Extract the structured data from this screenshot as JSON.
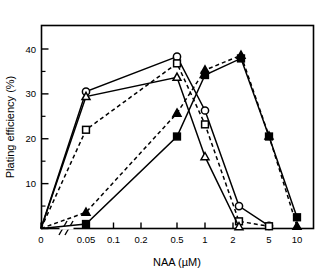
{
  "chart_data": {
    "type": "line",
    "title": "",
    "xlabel": "NAA (µM)",
    "ylabel": "Plating efficiency (%)",
    "x_tick_labels": [
      "0",
      "0.05",
      "0.1",
      "0.2",
      "0.5",
      "1",
      "2",
      "5",
      "10"
    ],
    "y_tick_labels": [
      "0",
      "10",
      "20",
      "30",
      "40"
    ],
    "y_ticks": [
      0,
      10,
      20,
      30,
      40
    ],
    "ylim": [
      0,
      46
    ],
    "x_scale": "log-with-axis-break",
    "axis_break": "between 0 and 0.05",
    "grid": false,
    "legend": "none",
    "series": [
      {
        "name": "open-circle",
        "marker": "open-circle",
        "line": "solid",
        "points": [
          {
            "x": "0",
            "y": 0.0
          },
          {
            "x": "0.05",
            "y": 30.5
          },
          {
            "x": "0.5",
            "y": 38.3
          },
          {
            "x": "1",
            "y": 26.3
          },
          {
            "x": "2.2",
            "y": 5.0
          },
          {
            "x": "5",
            "y": 0.6
          }
        ]
      },
      {
        "name": "open-square",
        "marker": "open-square",
        "line": "dashed",
        "points": [
          {
            "x": "0",
            "y": 0.0
          },
          {
            "x": "0.05",
            "y": 22.0
          },
          {
            "x": "0.5",
            "y": 36.8
          },
          {
            "x": "1",
            "y": 23.2
          },
          {
            "x": "2.2",
            "y": 1.6
          },
          {
            "x": "5",
            "y": 0.5
          }
        ]
      },
      {
        "name": "open-triangle",
        "marker": "open-triangle",
        "line": "solid",
        "points": [
          {
            "x": "0",
            "y": 0.0
          },
          {
            "x": "0.05",
            "y": 29.4
          },
          {
            "x": "0.5",
            "y": 33.7
          },
          {
            "x": "1",
            "y": 16.0
          },
          {
            "x": "2.2",
            "y": 0.4
          }
        ]
      },
      {
        "name": "filled-triangle",
        "marker": "filled-triangle",
        "line": "dashed",
        "points": [
          {
            "x": "0",
            "y": 0.0
          },
          {
            "x": "0.05",
            "y": 3.6
          },
          {
            "x": "0.5",
            "y": 25.7
          },
          {
            "x": "1",
            "y": 35.3
          },
          {
            "x": "2.3",
            "y": 38.6
          },
          {
            "x": "5",
            "y": 20.6
          },
          {
            "x": "10",
            "y": 0.5
          }
        ]
      },
      {
        "name": "filled-square",
        "marker": "filled-square",
        "line": "solid",
        "points": [
          {
            "x": "0",
            "y": 0.0
          },
          {
            "x": "0.05",
            "y": 1.0
          },
          {
            "x": "0.5",
            "y": 20.5
          },
          {
            "x": "1",
            "y": 34.2
          },
          {
            "x": "2.3",
            "y": 37.9
          },
          {
            "x": "5",
            "y": 20.5
          },
          {
            "x": "10",
            "y": 2.5
          }
        ]
      }
    ],
    "colors": {
      "line": "#000000",
      "marker_fill_open": "#ffffff",
      "marker_fill_closed": "#000000",
      "axis": "#000000",
      "background": "#ffffff"
    }
  }
}
